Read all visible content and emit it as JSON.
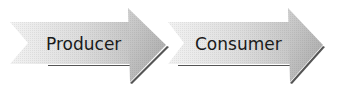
{
  "diagram": {
    "type": "process-flow",
    "arrows": [
      {
        "id": "producer",
        "label": "Producer"
      },
      {
        "id": "consumer",
        "label": "Consumer"
      }
    ],
    "colors": {
      "fill_light": "#e6e6e6",
      "fill_mid": "#c8c8c8",
      "head_fill": "#b4b4b4",
      "shadow": "#555555",
      "text": "#1a1a1a"
    }
  }
}
